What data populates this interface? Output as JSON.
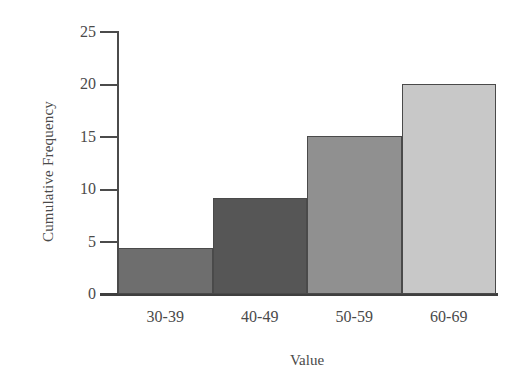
{
  "chart_data": {
    "type": "bar",
    "title": "",
    "subtitle": "",
    "xlabel": "Value",
    "ylabel": "Cumulative Frequency",
    "categories": [
      "30-39",
      "40-49",
      "50-59",
      "60-69"
    ],
    "values": [
      4.4,
      9.1,
      15,
      20
    ],
    "series": [
      {
        "name": "Cumulative Frequency",
        "values": [
          4.4,
          9.1,
          15,
          20
        ]
      }
    ],
    "ylim": [
      0,
      25
    ],
    "yticks": [
      0,
      5,
      10,
      15,
      20,
      25
    ],
    "ytick_labels": [
      "0",
      "5",
      "10",
      "15",
      "20",
      "25"
    ],
    "grid": false,
    "legend": false,
    "legend_position": "none",
    "bar_gap": 0,
    "annotations": [],
    "bar_colors": [
      "#6e6e6e",
      "#565656",
      "#909090",
      "#c8c8c8"
    ],
    "bar_border_color": "#4a4a4a",
    "axis_color": "#4b4b4b",
    "text_color": "#4a4a4a",
    "background_color": "#ffffff"
  }
}
